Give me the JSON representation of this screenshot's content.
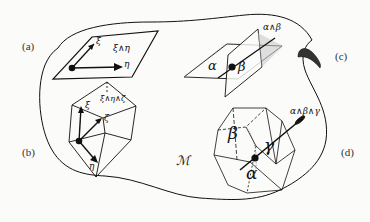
{
  "figure": {
    "manifold_label": "ℳ",
    "panels": [
      {
        "id": "a",
        "label": "(a)",
        "wedge": "ξ∧η",
        "vectors": [
          "ξ",
          "η"
        ],
        "description": "bivector spanned by two vectors"
      },
      {
        "id": "b",
        "label": "(b)",
        "wedge": "ξ∧η∧ζ",
        "vectors": [
          "ξ",
          "ζ",
          "η"
        ],
        "description": "trivector spanned by three vectors"
      },
      {
        "id": "c",
        "label": "(c)",
        "wedge": "α∧β",
        "forms": [
          "α",
          "β"
        ],
        "description": "2-form as intersection of two 1-form planes"
      },
      {
        "id": "d",
        "label": "(d)",
        "wedge": "α∧β∧γ",
        "forms": [
          "β",
          "γ",
          "α"
        ],
        "description": "3-form as cells of three 1-forms"
      }
    ]
  },
  "colors": {
    "ink": "#111111",
    "background": "#fbfbfa",
    "label": "#333333"
  }
}
